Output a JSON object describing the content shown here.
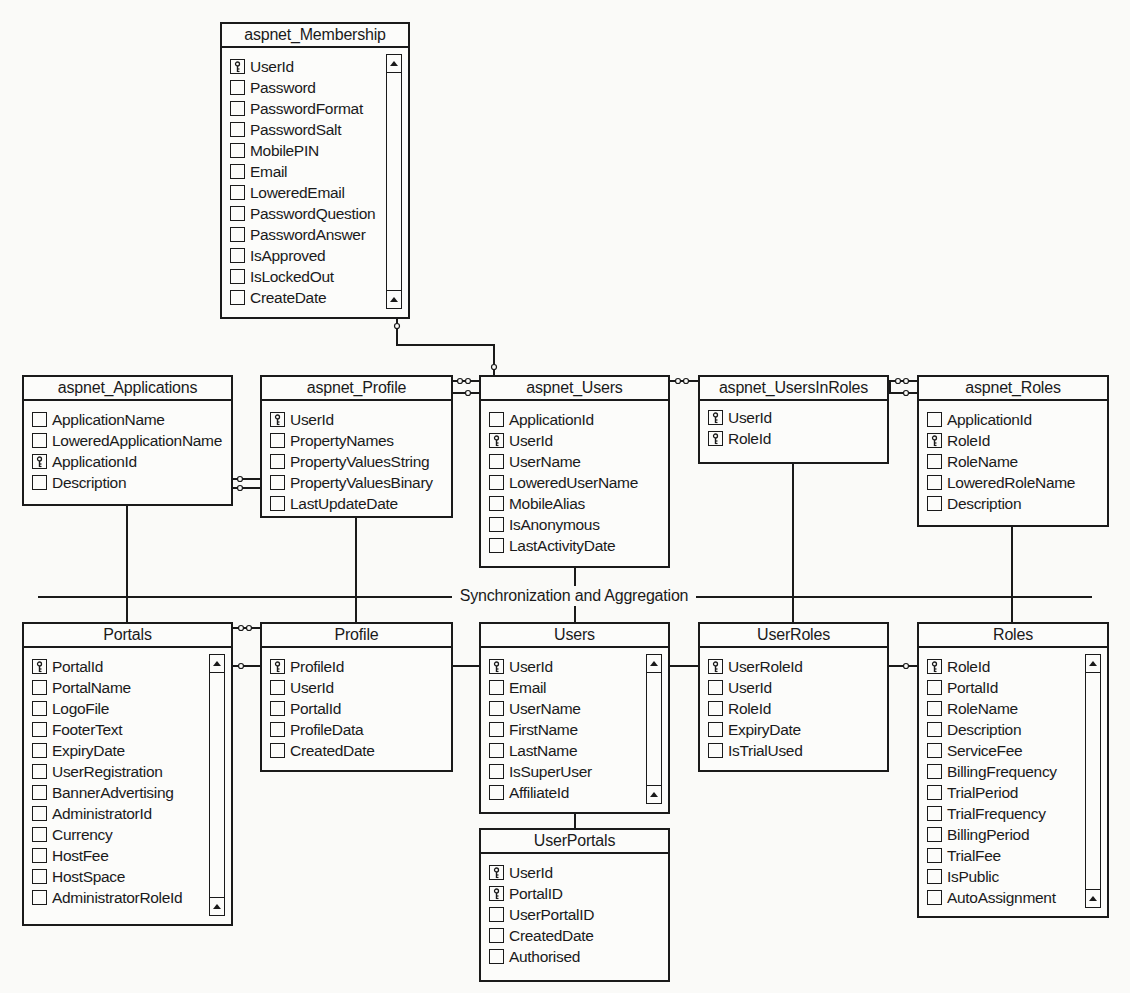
{
  "diagram": {
    "divider_label": "Synchronization and Aggregation",
    "tables": {
      "aspnet_membership": {
        "title": "aspnet_Membership",
        "scrollbar": true,
        "fields": [
          {
            "name": "UserId",
            "key": true
          },
          {
            "name": "Password",
            "key": false
          },
          {
            "name": "PasswordFormat",
            "key": false
          },
          {
            "name": "PasswordSalt",
            "key": false
          },
          {
            "name": "MobilePIN",
            "key": false
          },
          {
            "name": "Email",
            "key": false
          },
          {
            "name": "LoweredEmail",
            "key": false
          },
          {
            "name": "PasswordQuestion",
            "key": false
          },
          {
            "name": "PasswordAnswer",
            "key": false
          },
          {
            "name": "IsApproved",
            "key": false
          },
          {
            "name": "IsLockedOut",
            "key": false
          },
          {
            "name": "CreateDate",
            "key": false
          }
        ]
      },
      "aspnet_applications": {
        "title": "aspnet_Applications",
        "scrollbar": false,
        "fields": [
          {
            "name": "ApplicationName",
            "key": false
          },
          {
            "name": "LoweredApplicationName",
            "key": false
          },
          {
            "name": "ApplicationId",
            "key": true
          },
          {
            "name": "Description",
            "key": false
          }
        ]
      },
      "aspnet_profile": {
        "title": "aspnet_Profile",
        "scrollbar": false,
        "fields": [
          {
            "name": "UserId",
            "key": true
          },
          {
            "name": "PropertyNames",
            "key": false
          },
          {
            "name": "PropertyValuesString",
            "key": false
          },
          {
            "name": "PropertyValuesBinary",
            "key": false
          },
          {
            "name": "LastUpdateDate",
            "key": false
          }
        ]
      },
      "aspnet_users": {
        "title": "aspnet_Users",
        "scrollbar": false,
        "fields": [
          {
            "name": "ApplicationId",
            "key": false
          },
          {
            "name": "UserId",
            "key": true
          },
          {
            "name": "UserName",
            "key": false
          },
          {
            "name": "LoweredUserName",
            "key": false
          },
          {
            "name": "MobileAlias",
            "key": false
          },
          {
            "name": "IsAnonymous",
            "key": false
          },
          {
            "name": "LastActivityDate",
            "key": false
          }
        ]
      },
      "aspnet_usersinroles": {
        "title": "aspnet_UsersInRoles",
        "scrollbar": false,
        "fields": [
          {
            "name": "UserId",
            "key": true
          },
          {
            "name": "RoleId",
            "key": true
          }
        ]
      },
      "aspnet_roles": {
        "title": "aspnet_Roles",
        "scrollbar": false,
        "fields": [
          {
            "name": "ApplicationId",
            "key": false
          },
          {
            "name": "RoleId",
            "key": true
          },
          {
            "name": "RoleName",
            "key": false
          },
          {
            "name": "LoweredRoleName",
            "key": false
          },
          {
            "name": "Description",
            "key": false
          }
        ]
      },
      "portals": {
        "title": "Portals",
        "scrollbar": true,
        "fields": [
          {
            "name": "PortalId",
            "key": true
          },
          {
            "name": "PortalName",
            "key": false
          },
          {
            "name": "LogoFile",
            "key": false
          },
          {
            "name": "FooterText",
            "key": false
          },
          {
            "name": "ExpiryDate",
            "key": false
          },
          {
            "name": "UserRegistration",
            "key": false
          },
          {
            "name": "BannerAdvertising",
            "key": false
          },
          {
            "name": "AdministratorId",
            "key": false
          },
          {
            "name": "Currency",
            "key": false
          },
          {
            "name": "HostFee",
            "key": false
          },
          {
            "name": "HostSpace",
            "key": false
          },
          {
            "name": "AdministratorRoleId",
            "key": false
          }
        ]
      },
      "profile": {
        "title": "Profile",
        "scrollbar": false,
        "fields": [
          {
            "name": "ProfileId",
            "key": true
          },
          {
            "name": "UserId",
            "key": false
          },
          {
            "name": "PortalId",
            "key": false
          },
          {
            "name": "ProfileData",
            "key": false
          },
          {
            "name": "CreatedDate",
            "key": false
          }
        ]
      },
      "users": {
        "title": "Users",
        "scrollbar": true,
        "fields": [
          {
            "name": "UserId",
            "key": true
          },
          {
            "name": "Email",
            "key": false
          },
          {
            "name": "UserName",
            "key": false
          },
          {
            "name": "FirstName",
            "key": false
          },
          {
            "name": "LastName",
            "key": false
          },
          {
            "name": "IsSuperUser",
            "key": false
          },
          {
            "name": "AffiliateId",
            "key": false
          }
        ]
      },
      "userroles": {
        "title": "UserRoles",
        "scrollbar": false,
        "fields": [
          {
            "name": "UserRoleId",
            "key": true
          },
          {
            "name": "UserId",
            "key": false
          },
          {
            "name": "RoleId",
            "key": false
          },
          {
            "name": "ExpiryDate",
            "key": false
          },
          {
            "name": "IsTrialUsed",
            "key": false
          }
        ]
      },
      "roles": {
        "title": "Roles",
        "scrollbar": true,
        "fields": [
          {
            "name": "RoleId",
            "key": true
          },
          {
            "name": "PortalId",
            "key": false
          },
          {
            "name": "RoleName",
            "key": false
          },
          {
            "name": "Description",
            "key": false
          },
          {
            "name": "ServiceFee",
            "key": false
          },
          {
            "name": "BillingFrequency",
            "key": false
          },
          {
            "name": "TrialPeriod",
            "key": false
          },
          {
            "name": "TrialFrequency",
            "key": false
          },
          {
            "name": "BillingPeriod",
            "key": false
          },
          {
            "name": "TrialFee",
            "key": false
          },
          {
            "name": "IsPublic",
            "key": false
          },
          {
            "name": "AutoAssignment",
            "key": false
          }
        ]
      },
      "userportals": {
        "title": "UserPortals",
        "scrollbar": false,
        "fields": [
          {
            "name": "UserId",
            "key": true
          },
          {
            "name": "PortalID",
            "key": true
          },
          {
            "name": "UserPortalID",
            "key": false
          },
          {
            "name": "CreatedDate",
            "key": false
          },
          {
            "name": "Authorised",
            "key": false
          }
        ]
      }
    }
  }
}
